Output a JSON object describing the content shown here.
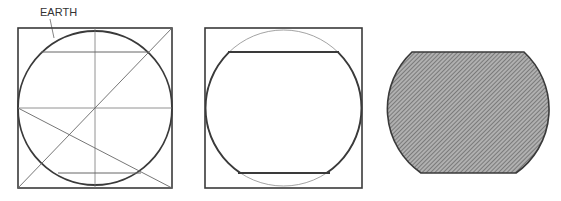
{
  "labels": {
    "earth": "EARTH"
  },
  "figures": [
    {
      "id": "construction",
      "description": "Circle inscribed in square with construction lines"
    },
    {
      "id": "outline",
      "description": "Circle in square with top and bottom chords cut"
    },
    {
      "id": "section",
      "description": "Hatched truncated circle section"
    }
  ],
  "colors": {
    "stroke": "#3a3a3a",
    "thin": "#6a6a6a",
    "hatch_bg": "#a8a8a8",
    "hatch_line": "#555555"
  }
}
